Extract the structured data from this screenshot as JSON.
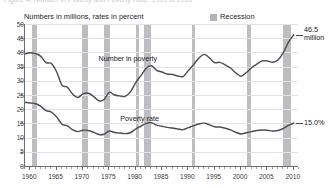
{
  "title": "Figure 4. Number in Poverty and Poverty Rate: 1959 to 2010",
  "subtitle": "Numbers in millions, rates in percent",
  "legend": {
    "recession_label": "Recession",
    "recession_color": "#bdbdc2"
  },
  "series_labels": {
    "number_in_poverty": "Number in poverty",
    "poverty_rate": "Poverty rate"
  },
  "callouts": {
    "number_value": "46.5",
    "number_unit": "million",
    "rate_value": "15.0%"
  },
  "axes": {
    "y_ticks": [
      "50",
      "45",
      "40",
      "35",
      "30",
      "25",
      "20",
      "15",
      "10",
      "5",
      "0"
    ],
    "x_ticks": [
      "1960",
      "1965",
      "1970",
      "1975",
      "1980",
      "1985",
      "1990",
      "1995",
      "2000",
      "2005",
      "2010"
    ]
  },
  "chart_data": {
    "type": "line",
    "title": "Figure 4. Number in Poverty and Poverty Rate: 1959 to 2010",
    "subtitle": "Numbers in millions, rates in percent",
    "xlabel": "",
    "ylabel": "Numbers in millions, rates in percent",
    "xlim": [
      1959,
      2011
    ],
    "ylim": [
      0,
      50
    ],
    "y_ticks": [
      0,
      5,
      10,
      15,
      20,
      25,
      30,
      35,
      40,
      45,
      50
    ],
    "x_ticks": [
      1960,
      1965,
      1970,
      1975,
      1980,
      1985,
      1990,
      1995,
      2000,
      2005,
      2010
    ],
    "grid": true,
    "legend_position": "top-right",
    "legend_entries": [
      "Recession"
    ],
    "line_color": "#4d4d53",
    "annotations": [
      {
        "text": "Number in poverty",
        "x": 1983,
        "y": 38
      },
      {
        "text": "Poverty rate",
        "x": 1986,
        "y": 17
      },
      {
        "text": "46.5 million",
        "x": 2010,
        "y": 46.5
      },
      {
        "text": "15.0%",
        "x": 2010,
        "y": 15.0
      }
    ],
    "recession_bands": [
      [
        1960.3,
        1961.2
      ],
      [
        1969.9,
        1970.9
      ],
      [
        1973.9,
        1975.2
      ],
      [
        1980.0,
        1980.6
      ],
      [
        1981.6,
        1982.9
      ],
      [
        1990.6,
        1991.2
      ],
      [
        2001.2,
        2001.9
      ],
      [
        2007.9,
        2009.5
      ]
    ],
    "x": [
      1959,
      1960,
      1961,
      1962,
      1963,
      1964,
      1965,
      1966,
      1967,
      1968,
      1969,
      1970,
      1971,
      1972,
      1973,
      1974,
      1975,
      1976,
      1977,
      1978,
      1979,
      1980,
      1981,
      1982,
      1983,
      1984,
      1985,
      1986,
      1987,
      1988,
      1989,
      1990,
      1991,
      1992,
      1993,
      1994,
      1995,
      1996,
      1997,
      1998,
      1999,
      2000,
      2001,
      2002,
      2003,
      2004,
      2005,
      2006,
      2007,
      2008,
      2009,
      2010
    ],
    "series": [
      {
        "name": "Number in poverty",
        "unit": "millions",
        "values": [
          39.5,
          39.9,
          39.6,
          38.6,
          36.4,
          36.1,
          33.2,
          28.5,
          27.8,
          25.4,
          24.1,
          25.4,
          25.6,
          24.5,
          23.0,
          23.4,
          25.9,
          25.0,
          24.7,
          24.5,
          26.1,
          29.3,
          31.8,
          34.4,
          35.3,
          33.7,
          33.1,
          32.4,
          32.2,
          31.7,
          31.5,
          33.6,
          35.7,
          38.0,
          39.3,
          38.1,
          36.4,
          36.5,
          35.6,
          34.5,
          32.8,
          31.6,
          32.9,
          34.6,
          35.9,
          37.0,
          37.0,
          36.5,
          37.3,
          39.8,
          43.6,
          46.2
        ],
        "end_label": "46.5 million"
      },
      {
        "name": "Poverty rate",
        "unit": "percent",
        "values": [
          22.4,
          22.2,
          21.9,
          21.0,
          19.5,
          19.0,
          17.3,
          14.7,
          14.2,
          12.8,
          12.1,
          12.6,
          12.5,
          11.9,
          11.1,
          11.2,
          12.3,
          11.8,
          11.6,
          11.4,
          11.7,
          13.0,
          14.0,
          15.0,
          15.2,
          14.4,
          14.0,
          13.6,
          13.4,
          13.0,
          12.8,
          13.5,
          14.2,
          14.8,
          15.1,
          14.5,
          13.8,
          13.7,
          13.3,
          12.7,
          11.9,
          11.3,
          11.7,
          12.1,
          12.5,
          12.7,
          12.6,
          12.3,
          12.5,
          13.2,
          14.3,
          15.1
        ],
        "end_label": "15.0%"
      }
    ]
  }
}
